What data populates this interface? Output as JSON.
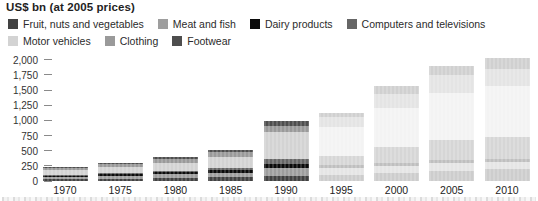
{
  "chart_data": {
    "type": "bar",
    "stacked": true,
    "title": "US$ bn (at 2005 prices)",
    "categories": [
      "1970",
      "1975",
      "1980",
      "1985",
      "1990",
      "1995",
      "2000",
      "2005",
      "2010"
    ],
    "series": [
      {
        "name": "Fruit, nuts and vegetables",
        "color": "#424242",
        "values": [
          30,
          40,
          50,
          60,
          75,
          100,
          140,
          170,
          195
        ]
      },
      {
        "name": "Meat and fish",
        "color": "#9e9e9e",
        "values": [
          40,
          50,
          65,
          80,
          145,
          115,
          115,
          120,
          120
        ]
      },
      {
        "name": "Dairy products",
        "color": "#0b0b0b",
        "values": [
          20,
          25,
          30,
          35,
          60,
          45,
          50,
          50,
          50
        ]
      },
      {
        "name": "Computers and televisions",
        "color": "#666666",
        "values": [
          10,
          15,
          20,
          40,
          80,
          150,
          260,
          330,
          360
        ]
      },
      {
        "name": "Motor vehicles",
        "color": "#d3d3d3",
        "values": [
          75,
          100,
          140,
          180,
          450,
          480,
          640,
          780,
          850
        ]
      },
      {
        "name": "Clothing",
        "color": "#9a9a9a",
        "values": [
          35,
          45,
          60,
          80,
          95,
          160,
          230,
          300,
          280
        ]
      },
      {
        "name": "Footwear",
        "color": "#4e4e4e",
        "values": [
          15,
          20,
          30,
          40,
          90,
          75,
          125,
          155,
          170
        ]
      }
    ],
    "stack_order": "bottom-to-top (series listed bottom first)",
    "ylim": [
      0,
      2000
    ],
    "ytick_step": 250,
    "ytick_labels": [
      "0",
      "250",
      "500",
      "750",
      "1,000",
      "1,250",
      "1,500",
      "1,750",
      "2,000"
    ],
    "faded_categories": [
      "1995",
      "2000",
      "2005",
      "2010"
    ],
    "legend_rows": [
      [
        0,
        1,
        2,
        3
      ],
      [
        4,
        5,
        6
      ]
    ],
    "xlabel": "",
    "ylabel": "US$ bn (at 2005 prices)",
    "grid": false,
    "legend_position": "top"
  }
}
